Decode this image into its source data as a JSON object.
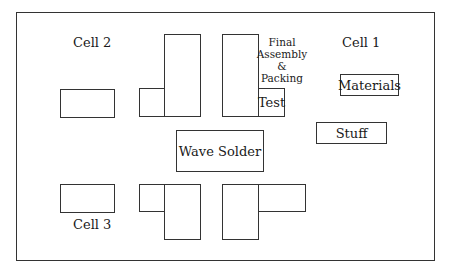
{
  "diagram": {
    "type": "factory-floor-layout",
    "cells": {
      "cell1": {
        "label": "Cell 1"
      },
      "cell2": {
        "label": "Cell 2"
      },
      "cell3": {
        "label": "Cell 3"
      }
    },
    "areas": {
      "final_assembly": {
        "lines": [
          "Final",
          "Assembly",
          "&",
          "Packing"
        ]
      },
      "test": {
        "label": "Test"
      },
      "materials": {
        "label": "Materials"
      },
      "stuff": {
        "label": "Stuff"
      },
      "wave_solder": {
        "label": "Wave Solder"
      }
    },
    "colors": {
      "stroke": "#333333",
      "background": "#ffffff",
      "text": "#1a1a1a"
    }
  }
}
